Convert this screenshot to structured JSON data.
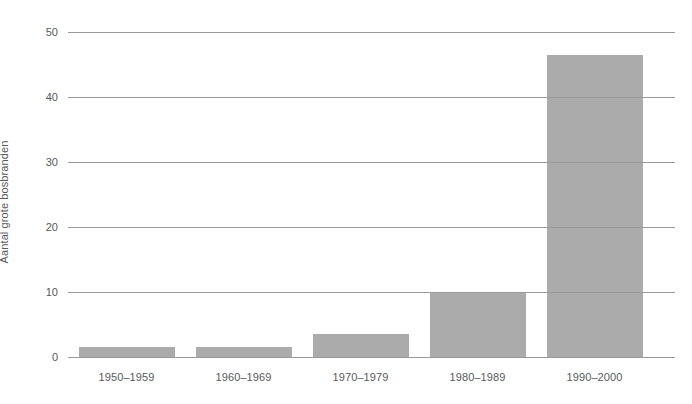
{
  "chart_data": {
    "type": "bar",
    "title": "",
    "subtitle": "",
    "xlabel": "",
    "ylabel": "Aantal grote bosbranden",
    "categories": [
      "1950–1959",
      "1960–1969",
      "1970–1979",
      "1980–1989",
      "1990–2000"
    ],
    "values": [
      1.5,
      1.5,
      3.5,
      10,
      46.5
    ],
    "series": [
      {
        "name": "Aantal grote bosbranden",
        "values": [
          1.5,
          1.5,
          3.5,
          10,
          46.5
        ]
      }
    ],
    "ylim": [
      0,
      50
    ],
    "yticks": [
      0,
      10,
      20,
      30,
      40,
      50
    ],
    "ytick_labels": [
      "0",
      "10",
      "20",
      "30",
      "40",
      "50"
    ],
    "grid": "horizontal",
    "legend": "none",
    "colors": {
      "bar": "#ababab",
      "gridline": "#9a9a9a",
      "text": "#58595b",
      "background": "#ffffff"
    }
  }
}
